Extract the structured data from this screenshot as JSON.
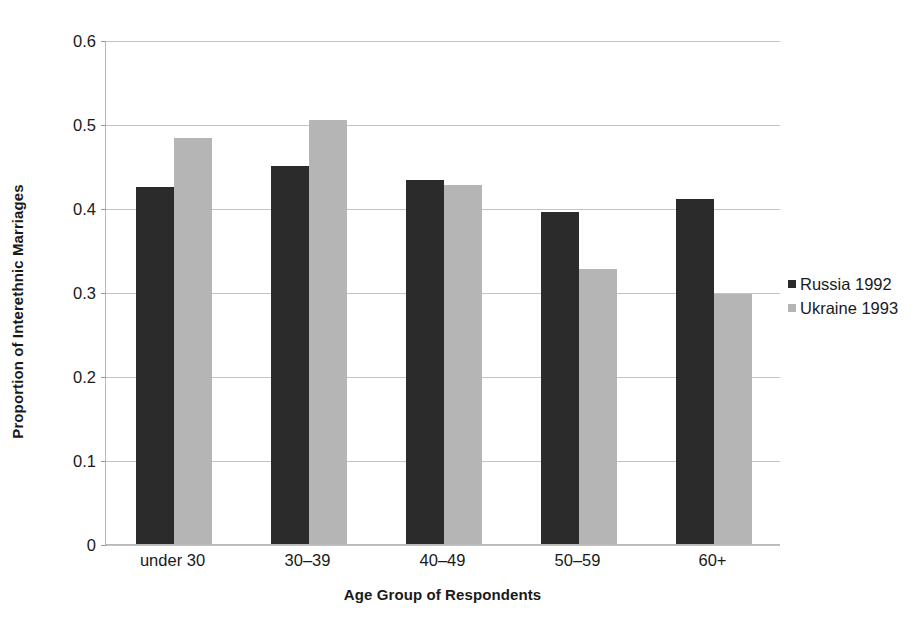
{
  "chart_data": {
    "type": "bar",
    "title": "",
    "xlabel": "Age Group of Respondents",
    "ylabel": "Proportion of Interethnic Marriages",
    "categories": [
      "under 30",
      "30–39",
      "40–49",
      "50–59",
      "60+"
    ],
    "series": [
      {
        "name": "Russia 1992",
        "color": "#2b2b2b",
        "values": [
          0.426,
          0.451,
          0.434,
          0.396,
          0.412
        ]
      },
      {
        "name": "Ukraine 1993",
        "color": "#b5b5b5",
        "values": [
          0.485,
          0.506,
          0.428,
          0.329,
          0.299
        ]
      }
    ],
    "ylim": [
      0,
      0.6
    ],
    "ytick_values": [
      0,
      0.1,
      0.2,
      0.3,
      0.4,
      0.5,
      0.6
    ],
    "ytick_labels": [
      "0",
      "0.1",
      "0.2",
      "0.3",
      "0.4",
      "0.5",
      "0.6"
    ],
    "grid": true,
    "grid_axis": "y",
    "legend_position": "right",
    "background": "#ffffff"
  }
}
